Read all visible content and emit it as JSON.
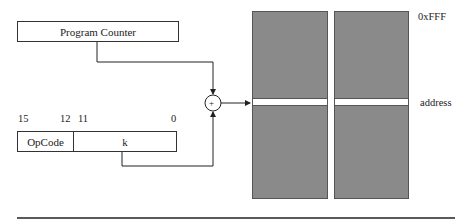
{
  "diagram": {
    "program_counter": {
      "label": "Program Counter"
    },
    "instruction": {
      "bit_labels": [
        "15",
        "12",
        "11",
        "0"
      ],
      "fields": [
        {
          "name": "opcode",
          "label": "OpCode"
        },
        {
          "name": "k",
          "label": "k"
        }
      ]
    },
    "adder": {
      "symbol": "+"
    },
    "memory": {
      "top_label": "0xFFF",
      "address_label": "address",
      "block_count": 2,
      "fill_color": "#8a8a8a"
    }
  }
}
